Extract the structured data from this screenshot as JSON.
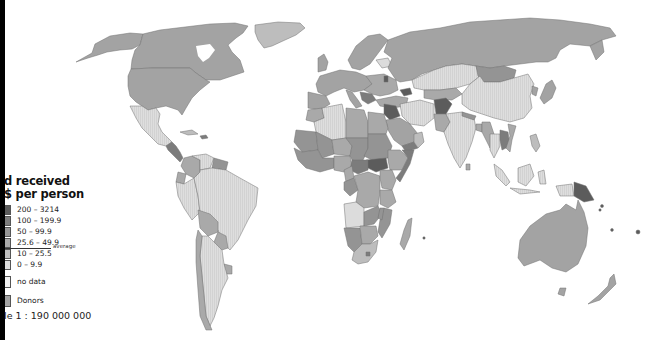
{
  "map": {
    "title_line1": "d received",
    "title_line2": "$ per person",
    "legend": [
      {
        "label": "200 – 3214",
        "color": "#5c5c5c"
      },
      {
        "label": "100 – 199.9",
        "color": "#7c7c7c"
      },
      {
        "label": "50 – 99.9",
        "color": "#949494"
      },
      {
        "label": "25.6 – 49.9",
        "color": "#a9a9a9"
      },
      {
        "label": "10 – 25.5",
        "color": "#bdbdbd"
      },
      {
        "label": "0 – 9.9",
        "color": "#dcdcdc"
      },
      {
        "label": "no data",
        "color": "#f2f2f2"
      },
      {
        "label": "Donors",
        "color": "#a3a3a3"
      }
    ],
    "average_label": "average",
    "scale": "le 1 : 190 000 000",
    "colors": {
      "background": "#ffffff",
      "border": "#707070",
      "donor": "#a3a3a3",
      "low": "#dcdcdc",
      "midlow": "#bdbdbd",
      "mid": "#a9a9a9",
      "midhigh": "#949494",
      "high": "#7c7c7c",
      "highest": "#5c5c5c"
    }
  }
}
